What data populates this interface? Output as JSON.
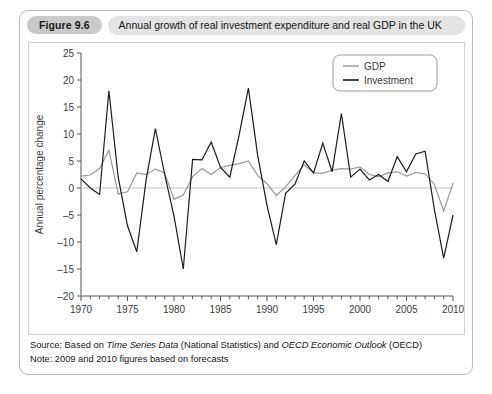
{
  "figure": {
    "badge_label": "Figure 9.6",
    "title": "Annual growth of real investment expenditure and real GDP in the UK",
    "source_prefix": "Source: Based on ",
    "source_italic_1": "Time Series Data",
    "source_mid": " (National Statistics) and ",
    "source_italic_2": "OECD Economic Outlook",
    "source_suffix": " (OECD)",
    "note": "Note: 2009 and 2010 figures based on forecasts"
  },
  "legend": {
    "gdp_label": "GDP",
    "investment_label": "Investment",
    "gdp_color": "#999999",
    "investment_color": "#1c1c1c"
  },
  "axes": {
    "y_title": "Annual percentage change",
    "y_ticks": [
      "25",
      "20",
      "15",
      "10",
      "5",
      "0",
      "-5",
      "-10",
      "-15",
      "-20"
    ],
    "x_ticks": [
      "1970",
      "1975",
      "1980",
      "1985",
      "1990",
      "1995",
      "2000",
      "2005",
      "2010"
    ]
  },
  "chart_data": {
    "type": "line",
    "title": "Annual growth of real investment expenditure and real GDP in the UK",
    "xlabel": "",
    "ylabel": "Annual percentage change",
    "xlim": [
      1970,
      2010
    ],
    "ylim": [
      -20,
      25
    ],
    "grid": false,
    "legend_position": "top-right",
    "x": [
      1970,
      1971,
      1972,
      1973,
      1974,
      1975,
      1976,
      1977,
      1978,
      1979,
      1980,
      1981,
      1982,
      1983,
      1984,
      1985,
      1986,
      1987,
      1988,
      1989,
      1990,
      1991,
      1992,
      1993,
      1994,
      1995,
      1996,
      1997,
      1998,
      1999,
      2000,
      2001,
      2002,
      2003,
      2004,
      2005,
      2006,
      2007,
      2008,
      2009,
      2010
    ],
    "series": [
      {
        "name": "GDP",
        "color": "#999999",
        "values": [
          2.2,
          2.4,
          3.6,
          7.0,
          -1.1,
          -0.7,
          2.8,
          2.5,
          3.5,
          2.8,
          -2.1,
          -1.3,
          2.1,
          3.6,
          2.5,
          3.8,
          4.2,
          4.5,
          5.0,
          2.3,
          0.8,
          -1.4,
          0.2,
          2.3,
          4.3,
          2.8,
          2.7,
          3.3,
          3.6,
          3.5,
          3.9,
          2.5,
          2.1,
          2.8,
          3.0,
          2.2,
          2.9,
          2.6,
          0.7,
          -4.3,
          0.9
        ]
      },
      {
        "name": "Investment",
        "color": "#1c1c1c",
        "values": [
          1.7,
          0.0,
          -1.2,
          18.0,
          2.0,
          -7.0,
          -11.8,
          1.5,
          11.0,
          2.5,
          -5.2,
          -15.0,
          5.3,
          5.2,
          8.5,
          3.8,
          2.0,
          9.8,
          18.5,
          6.0,
          -3.2,
          -10.5,
          -1.0,
          0.7,
          5.0,
          2.8,
          8.3,
          3.0,
          13.8,
          2.0,
          3.5,
          1.5,
          2.5,
          1.2,
          5.8,
          3.0,
          6.3,
          6.8,
          -4.0,
          -13.0,
          -5.0
        ]
      }
    ]
  }
}
